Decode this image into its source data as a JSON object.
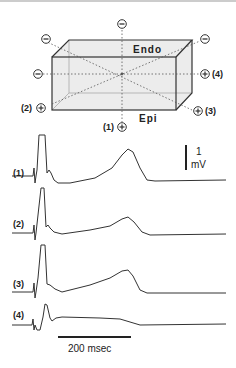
{
  "diagram": {
    "box_labels": {
      "top": "Endo",
      "bottom": "Epi"
    },
    "electrodes": [
      {
        "id": "top-center",
        "sign": "−",
        "label": ""
      },
      {
        "id": "top-left",
        "sign": "−",
        "label": ""
      },
      {
        "id": "top-right",
        "sign": "−",
        "label": ""
      },
      {
        "id": "mid-left",
        "sign": "−",
        "label": ""
      },
      {
        "id": "lead-4",
        "sign": "+",
        "label": "(4)"
      },
      {
        "id": "lead-2",
        "sign": "+",
        "label": "(2)"
      },
      {
        "id": "lead-3",
        "sign": "+",
        "label": "(3)"
      },
      {
        "id": "lead-1",
        "sign": "+",
        "label": "(1)"
      }
    ],
    "colors": {
      "line": "#333333",
      "box_fill": "#ececec",
      "dotted": "#555555"
    }
  },
  "traces": [
    {
      "label": "(1)"
    },
    {
      "label": "(2)"
    },
    {
      "label": "(3)"
    },
    {
      "label": "(4)"
    }
  ],
  "scale_bars": {
    "voltage_value": "1",
    "voltage_unit": "mV",
    "time": "200 msec"
  }
}
